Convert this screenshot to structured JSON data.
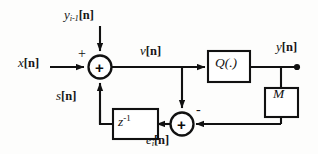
{
  "diagram": {
    "canvas": {
      "width": 318,
      "height": 154,
      "background": "#fdfdfc"
    },
    "stroke_color": "#111111",
    "signals": {
      "input": {
        "base": "x",
        "bracket": "[n]"
      },
      "dither": {
        "base": "y",
        "subscript": "i-1",
        "bracket": "[n]"
      },
      "presum": {
        "base": "v",
        "bracket": "[n]"
      },
      "output": {
        "base": "y",
        "bracket": "[n]"
      },
      "feedback": {
        "base": "s",
        "bracket": "[n]"
      },
      "error": {
        "base": "e",
        "subscript": "i",
        "bracket": "[n]"
      }
    },
    "blocks": {
      "quantizer": {
        "label": "Q(.)"
      },
      "gain": {
        "label": "M"
      },
      "delay": {
        "base": "z",
        "exponent": "-1"
      }
    },
    "operators": {
      "top_adder_inner": "+",
      "bottom_adder_inner": "+",
      "input_sign": "+",
      "feedback_sign": "-"
    }
  }
}
